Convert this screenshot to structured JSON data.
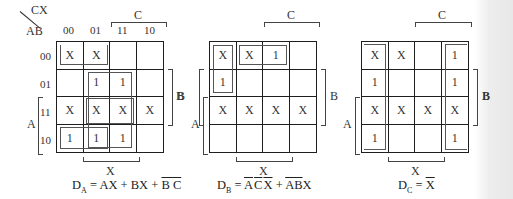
{
  "corner": {
    "col_var": "CX",
    "row_var": "AB"
  },
  "col_headers": [
    "00",
    "01",
    "11",
    "10"
  ],
  "row_headers": [
    "00",
    "01",
    "11",
    "10"
  ],
  "var_labels": {
    "C": "C",
    "B": "B",
    "A": "A",
    "X": "X"
  },
  "maps": [
    {
      "name": "DA",
      "cells": [
        [
          "X",
          "X",
          "",
          ""
        ],
        [
          "",
          "1",
          "1",
          ""
        ],
        [
          "X",
          "X",
          "X",
          "X"
        ],
        [
          "1",
          "1",
          "1",
          ""
        ]
      ],
      "equation": {
        "lhs": "D",
        "sub": "A",
        "eq": " = AX + BX + ",
        "term_overline": "B C"
      }
    },
    {
      "name": "DB",
      "cells": [
        [
          "X",
          "X",
          "1",
          ""
        ],
        [
          "1",
          "",
          "",
          ""
        ],
        [
          "X",
          "X",
          "X",
          "X"
        ],
        [
          "",
          "",
          "",
          ""
        ]
      ],
      "equation": {
        "lhs": "D",
        "sub": "B",
        "eq": " = ",
        "t1_ov_a": "A",
        "t1_ov_c": "C",
        "t1_ov_x": "X",
        "plus": " + ",
        "t2_ov_ab": "AB",
        "t2_x": "X"
      }
    },
    {
      "name": "DC",
      "cells": [
        [
          "X",
          "X",
          "",
          "1"
        ],
        [
          "1",
          "",
          "",
          "1"
        ],
        [
          "X",
          "X",
          "X",
          "X"
        ],
        [
          "1",
          "",
          "",
          "1"
        ]
      ],
      "equation": {
        "lhs": "D",
        "sub": "C",
        "eq": " = ",
        "ov_x": "X"
      }
    }
  ]
}
